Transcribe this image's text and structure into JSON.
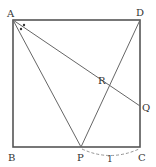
{
  "diagram": {
    "type": "geometry-square",
    "labels": {
      "A": "A",
      "B": "B",
      "C": "C",
      "D": "D",
      "P": "P",
      "Q": "Q",
      "R": "R",
      "pc_length": "1"
    },
    "points": {
      "A": [
        13,
        20
      ],
      "B": [
        13,
        147
      ],
      "C": [
        140,
        147
      ],
      "D": [
        140,
        20
      ],
      "P": [
        81,
        147
      ],
      "Q": [
        140,
        106
      ],
      "R": [
        106,
        85
      ]
    },
    "segments": [
      "AB",
      "BC",
      "CD",
      "DA",
      "AP",
      "AQ",
      "DP"
    ],
    "angle_marks": "two equal angles at A (dots) between AD/AQ and AQ/AP",
    "colors": {
      "line": "#555555",
      "text": "#333333",
      "dashed": "#888888"
    }
  }
}
